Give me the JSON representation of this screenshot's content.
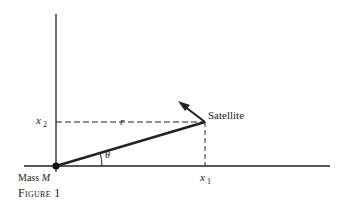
{
  "diagram": {
    "labels": {
      "satellite": "Satellite",
      "x2_var": "x",
      "x2_sub": "2",
      "x1_var": "x",
      "x1_sub": "1",
      "r": "r",
      "theta": "θ",
      "mass_prefix": "Mass",
      "mass_var": "M"
    },
    "caption": "Figure 1",
    "colors": {
      "line": "#222222",
      "background": "#ffffff"
    },
    "geometry": {
      "origin": [
        56,
        166
      ],
      "satellite": [
        205,
        122
      ],
      "arrow_tip": [
        180,
        104
      ]
    }
  }
}
